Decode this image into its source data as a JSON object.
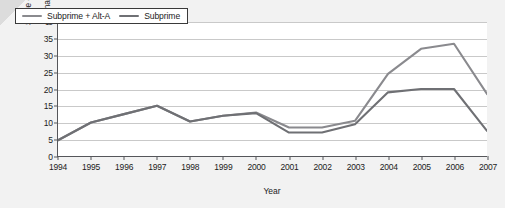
{
  "chart_data": {
    "type": "line",
    "title": "",
    "xlabel": "Year",
    "ylabel_line1": "Share of mortgages",
    "ylabel_line2": "originated (percent)",
    "categories": [
      1994,
      1995,
      1996,
      1997,
      1998,
      1999,
      2000,
      2001,
      2002,
      2003,
      2004,
      2005,
      2006,
      2007
    ],
    "x_tick_labels": [
      "1994",
      "1995",
      "1996",
      "1997",
      "1998",
      "1999",
      "2000",
      "2001",
      "2002",
      "2003",
      "2004",
      "2005",
      "2006",
      "2007"
    ],
    "y_tick_labels": [
      "0",
      "5",
      "10",
      "15",
      "20",
      "25",
      "30",
      "35",
      "40"
    ],
    "y_ticks": [
      0,
      5,
      10,
      15,
      20,
      25,
      30,
      35,
      40
    ],
    "ylim": [
      0,
      40
    ],
    "grid": true,
    "legend_position": "top-left",
    "series": [
      {
        "name": "Subprime + Alt-A",
        "color": "#8a8a8e",
        "values": [
          4.7,
          10.0,
          12.5,
          15.0,
          10.3,
          12.0,
          13.0,
          8.5,
          8.5,
          10.5,
          24.5,
          32.0,
          33.5,
          18.5
        ]
      },
      {
        "name": "Subprime",
        "color": "#6f7074",
        "values": [
          4.7,
          10.0,
          12.5,
          15.0,
          10.3,
          12.0,
          12.8,
          7.0,
          7.0,
          9.5,
          19.0,
          20.0,
          20.0,
          7.5
        ]
      }
    ]
  },
  "legend": {
    "entries": [
      {
        "label": "Subprime + Alt-A"
      },
      {
        "label": "Subprime"
      }
    ]
  }
}
